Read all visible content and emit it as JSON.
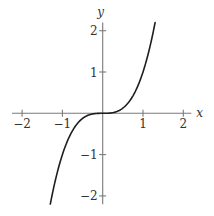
{
  "chart_data": {
    "type": "line",
    "title": "",
    "function": "y = x^3",
    "xlabel": "x",
    "ylabel": "y",
    "xlim": [
      -2.25,
      2.2
    ],
    "ylim": [
      -2.2,
      2.2
    ],
    "grid": false,
    "legend": null,
    "x_ticks": [
      {
        "value": -2,
        "label": "−2"
      },
      {
        "value": -1,
        "label": "−1"
      },
      {
        "value": 1,
        "label": "1"
      },
      {
        "value": 2,
        "label": "2"
      }
    ],
    "y_ticks": [
      {
        "value": 2,
        "label": "2"
      },
      {
        "value": 1,
        "label": "1"
      },
      {
        "value": -1,
        "label": "−1"
      },
      {
        "value": -2,
        "label": "−2"
      }
    ],
    "series": [
      {
        "name": "x^3",
        "color": "#1e1e1e",
        "domain": [
          -1.3,
          1.3
        ],
        "x": [
          -1.3,
          -1.2,
          -1.1,
          -1.0,
          -0.9,
          -0.8,
          -0.7,
          -0.6,
          -0.5,
          -0.4,
          -0.3,
          -0.2,
          -0.1,
          0.0,
          0.1,
          0.2,
          0.3,
          0.4,
          0.5,
          0.6,
          0.7,
          0.8,
          0.9,
          1.0,
          1.1,
          1.2,
          1.3
        ],
        "y": [
          -2.197,
          -1.728,
          -1.331,
          -1.0,
          -0.729,
          -0.512,
          -0.343,
          -0.216,
          -0.125,
          -0.064,
          -0.027,
          -0.008,
          -0.001,
          0.0,
          0.001,
          0.008,
          0.027,
          0.064,
          0.125,
          0.216,
          0.343,
          0.512,
          0.729,
          1.0,
          1.331,
          1.728,
          2.197
        ]
      }
    ]
  }
}
